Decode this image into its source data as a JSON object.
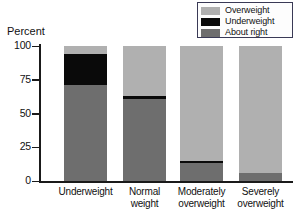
{
  "chart_data": {
    "type": "bar",
    "stacked": true,
    "title": "",
    "xlabel": "",
    "ylabel": "Percent",
    "ylim": [
      0,
      100
    ],
    "yticks": [
      0,
      25,
      50,
      75,
      100
    ],
    "ytick_labels": [
      "0",
      "25",
      "50",
      "75",
      "100"
    ],
    "grid": false,
    "legend_position": "top-right",
    "categories": [
      "Underweight",
      "Normal weight",
      "Moderately overweight",
      "Severely overweight"
    ],
    "category_lines": [
      [
        "Underweight"
      ],
      [
        "Normal",
        "weight"
      ],
      [
        "Moderately",
        "overweight"
      ],
      [
        "Severely",
        "overweight"
      ]
    ],
    "series": [
      {
        "name": "Overweight",
        "color": "#b0b0b0",
        "values": [
          6,
          37,
          85,
          94
        ]
      },
      {
        "name": "Underweight",
        "color": "#0a0a0a",
        "values": [
          23,
          2,
          2,
          0
        ]
      },
      {
        "name": "About right",
        "color": "#6e6e6e",
        "values": [
          71,
          61,
          13,
          6
        ]
      }
    ]
  },
  "legend": {
    "items": [
      {
        "label": "Overweight",
        "color": "#b0b0b0"
      },
      {
        "label": "Underweight",
        "color": "#0a0a0a"
      },
      {
        "label": "About right",
        "color": "#6e6e6e"
      }
    ]
  },
  "axis": {
    "y_title": "Percent",
    "y_ticks": [
      "100",
      "75",
      "50",
      "25",
      "0"
    ]
  },
  "colors": {
    "overweight": "#b0b0b0",
    "underweight": "#0a0a0a",
    "about_right": "#6e6e6e",
    "axis": "#1a1a1a",
    "legend_border": "#3a3a56",
    "background": "#ffffff"
  }
}
